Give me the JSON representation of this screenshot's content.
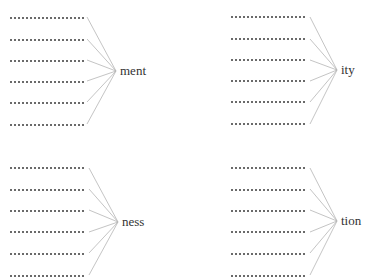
{
  "worksheet": {
    "groups": [
      {
        "suffix": "ment",
        "blank_rows": 6
      },
      {
        "suffix": "ity",
        "blank_rows": 6
      },
      {
        "suffix": "ness",
        "blank_rows": 6
      },
      {
        "suffix": "tion",
        "blank_rows": 6
      }
    ]
  },
  "colors": {
    "dots": "#6a6a6a",
    "lines": "#b5b5b5",
    "text": "#333333"
  }
}
